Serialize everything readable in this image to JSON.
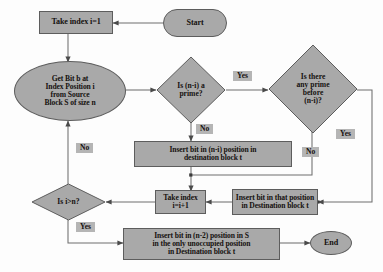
{
  "diagram": {
    "palette": {
      "node_fill": "#a9a9a9",
      "node_stroke": "#5d5d5d",
      "label_fill": "#b5b5b5",
      "text": "#15110f",
      "wire": "#6f6f6f",
      "background": "#fdfdfd"
    },
    "nodes": {
      "start": {
        "label": "Start",
        "shape": "terminator"
      },
      "take_index_1": {
        "label": "Take index i=1",
        "shape": "process"
      },
      "get_bit": {
        "label": "Get Bit b at Index Position i from  Source Block S of size n",
        "shape": "ellipse",
        "lines": [
          "Get Bit b at",
          "Index Position i",
          "from  Source",
          "Block S of size n"
        ]
      },
      "is_prime": {
        "label": "Is (n-i)  a prime?",
        "shape": "decision",
        "lines": [
          "Is (n-i)  a",
          "prime?"
        ]
      },
      "any_prime_before": {
        "label": "Is there any prime before (n-i)?",
        "shape": "decision",
        "lines": [
          "Is there",
          "any prime",
          "before",
          "(n-i)?"
        ]
      },
      "insert_ni": {
        "label": "Insert bit in (n-i) position in destination block t",
        "shape": "process",
        "lines": [
          "Insert bit in (n-i) position in",
          "destination block t"
        ]
      },
      "insert_that_position": {
        "label": "Insert bit in that position in Destination block t",
        "shape": "process",
        "lines": [
          "Insert bit in that position",
          "in Destination block t"
        ]
      },
      "take_index_inc": {
        "label": "Take index i=i+1",
        "shape": "process",
        "lines": [
          "Take index",
          "i=i+1"
        ]
      },
      "is_i_gt_n": {
        "label": "Is i>n?",
        "shape": "decision",
        "lines": [
          "Is i>n?"
        ]
      },
      "insert_n2": {
        "label": "Insert bit in (n-2) position in  S in the only unoccupied  position in Destination block t",
        "shape": "process",
        "lines": [
          "Insert bit in (n-2) position in  S",
          "in the only unoccupied  position",
          "in Destination block t"
        ]
      },
      "end": {
        "label": "End",
        "shape": "ellipse"
      }
    },
    "edge_labels": {
      "prime_yes": "Yes",
      "prime_no": "No",
      "before_yes": "Yes",
      "before_no": "No",
      "loop_no": "No",
      "loop_yes": "Yes"
    }
  }
}
